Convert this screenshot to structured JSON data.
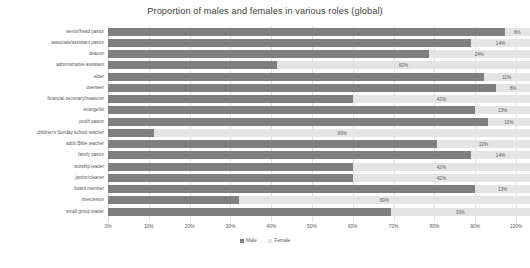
{
  "chart_data": {
    "type": "bar",
    "orientation": "horizontal",
    "stacked": true,
    "title": "Proportion of males and females in various roles (global)",
    "xlabel": "",
    "ylabel": "",
    "xlim": [
      0,
      100
    ],
    "grid": true,
    "legend_position": "bottom",
    "categories": [
      "senior/head pastor",
      "associate/assistant pastor",
      "deacon",
      "administrative assistant",
      "elder",
      "overseer",
      "financial secretary/treasurer",
      "evangelist",
      "youth pastor",
      "children's Sunday school teacher",
      "adult Bible teacher",
      "family pastor",
      "worship leader",
      "janitor/cleaner",
      "board member",
      "intercessor",
      "small group leader"
    ],
    "series": [
      {
        "name": "Male",
        "color": "#7f7f7f",
        "values": [
          94,
          86,
          76,
          40,
          89,
          92,
          58,
          87,
          90,
          11,
          78,
          86,
          58,
          58,
          87,
          31,
          67
        ]
      },
      {
        "name": "Female",
        "color": "#e4e4e4",
        "values": [
          6,
          14,
          24,
          60,
          11,
          8,
          42,
          13,
          10,
          89,
          22,
          14,
          42,
          42,
          13,
          69,
          33
        ]
      }
    ],
    "data_labels": [
      "6%",
      "14%",
      "24%",
      "60%",
      "11%",
      "8%",
      "42%",
      "13%",
      "10%",
      "89%",
      "22%",
      "14%",
      "42%",
      "42%",
      "13%",
      "69%",
      "33%"
    ],
    "xticks": [
      "0%",
      "10%",
      "20%",
      "30%",
      "40%",
      "50%",
      "60%",
      "70%",
      "80%",
      "90%",
      "100%"
    ],
    "xtick_values": [
      0,
      10,
      20,
      30,
      40,
      50,
      60,
      70,
      80,
      90,
      100
    ]
  },
  "legend": {
    "items": [
      {
        "label": "Male",
        "swatch": "male-swatch"
      },
      {
        "label": "Female",
        "swatch": "female-swatch"
      }
    ]
  },
  "caption": {
    "text": ""
  }
}
